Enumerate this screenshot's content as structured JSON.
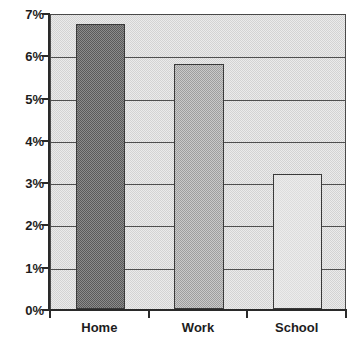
{
  "chart_data": {
    "type": "bar",
    "title": "",
    "title_note": "title-cropped-at-top-edge-unreadable",
    "xlabel": "",
    "ylabel": "",
    "categories": [
      "Home",
      "Work",
      "School"
    ],
    "values": [
      6.75,
      5.8,
      3.2
    ],
    "series": [
      {
        "name": "Percent",
        "values": [
          6.75,
          5.8,
          3.2
        ]
      }
    ],
    "value_format": "percent",
    "ylim": [
      0,
      7
    ],
    "ytick_step": 1,
    "ytick_labels": [
      "0%",
      "1%",
      "2%",
      "3%",
      "4%",
      "5%",
      "6%",
      "7%"
    ],
    "ytick_values": [
      0,
      1,
      2,
      3,
      4,
      5,
      6,
      7
    ],
    "grid": true,
    "grid_axis": "y",
    "legend": false,
    "legend_position": "none",
    "bar_fills": [
      "dark-gray-dither",
      "medium-gray-dither",
      "light-gray-dither"
    ],
    "annotations": []
  },
  "colors": {
    "page_background": "#ffffff",
    "plot_background": "#d3d3d3",
    "gridline": "#4f4f4f",
    "axis": "#2a2a2a",
    "bar_home": "#5a5a5a",
    "bar_work": "#9e9e9e",
    "bar_school": "#ececec",
    "bar_border": "#3a3a3a",
    "text": "#1d1d1d"
  }
}
